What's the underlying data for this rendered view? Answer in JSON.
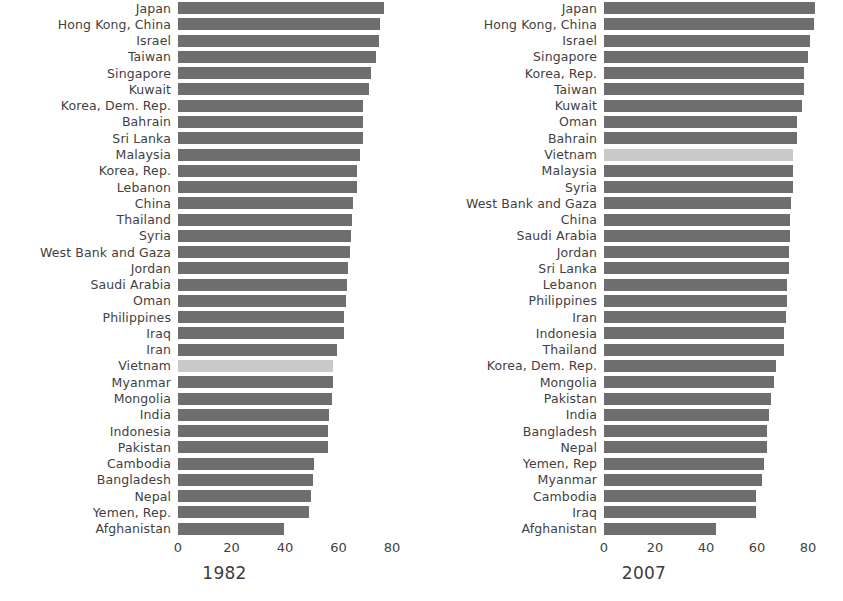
{
  "chart_data": [
    {
      "type": "bar",
      "orientation": "horizontal",
      "title": "1982",
      "xlabel": "",
      "ylabel": "",
      "xlim": [
        0,
        84
      ],
      "xticks": [
        0,
        20,
        40,
        60,
        80
      ],
      "grid": false,
      "legend": null,
      "highlight_category": "Vietnam",
      "colors": {
        "bar": "#6e6e6e",
        "highlight": "#c9c9c9",
        "text": "#3f3f3f"
      },
      "categories": [
        "Japan",
        "Hong Kong, China",
        "Israel",
        "Taiwan",
        "Singapore",
        "Kuwait",
        "Korea, Dem. Rep.",
        "Bahrain",
        "Sri Lanka",
        "Malaysia",
        "Korea, Rep.",
        "Lebanon",
        "China",
        "Thailand",
        "Syria",
        "West Bank and Gaza",
        "Jordan",
        "Saudi Arabia",
        "Oman",
        "Philippines",
        "Iraq",
        "Iran",
        "Vietnam",
        "Myanmar",
        "Mongolia",
        "India",
        "Indonesia",
        "Pakistan",
        "Cambodia",
        "Bangladesh",
        "Nepal",
        "Yemen, Rep.",
        "Afghanistan"
      ],
      "values": [
        77.1,
        75.4,
        75.0,
        74.0,
        72.0,
        71.3,
        69.1,
        69.1,
        69.0,
        68.0,
        67.1,
        66.9,
        65.5,
        65.0,
        64.6,
        64.4,
        63.7,
        63.0,
        62.7,
        62.1,
        62.0,
        59.6,
        58.0,
        58.0,
        57.5,
        56.6,
        56.2,
        56.2,
        50.9,
        50.3,
        49.6,
        49.1,
        39.8
      ]
    },
    {
      "type": "bar",
      "orientation": "horizontal",
      "title": "2007",
      "xlabel": "",
      "ylabel": "",
      "xlim": [
        0,
        84
      ],
      "xticks": [
        0,
        20,
        40,
        60,
        80
      ],
      "grid": false,
      "legend": null,
      "highlight_category": "Vietnam",
      "colors": {
        "bar": "#6e6e6e",
        "highlight": "#c9c9c9",
        "text": "#3f3f3f"
      },
      "categories": [
        "Japan",
        "Hong Kong, China",
        "Israel",
        "Singapore",
        "Korea, Rep.",
        "Taiwan",
        "Kuwait",
        "Oman",
        "Bahrain",
        "Vietnam",
        "Malaysia",
        "Syria",
        "West Bank and Gaza",
        "China",
        "Saudi Arabia",
        "Jordan",
        "Sri Lanka",
        "Lebanon",
        "Philippines",
        "Iran",
        "Indonesia",
        "Thailand",
        "Korea, Dem. Rep.",
        "Mongolia",
        "Pakistan",
        "India",
        "Bangladesh",
        "Nepal",
        "Yemen, Rep",
        "Myanmar",
        "Cambodia",
        "Iraq",
        "Afghanistan"
      ],
      "values": [
        82.6,
        82.2,
        80.7,
        80.0,
        78.6,
        78.4,
        77.6,
        75.6,
        75.6,
        74.2,
        74.2,
        74.1,
        73.3,
        73.0,
        72.8,
        72.5,
        72.4,
        71.9,
        71.7,
        71.2,
        70.6,
        70.6,
        67.3,
        66.8,
        65.5,
        64.7,
        64.1,
        63.8,
        62.7,
        62.1,
        59.7,
        59.5,
        43.8
      ]
    }
  ],
  "panels": {
    "left": {
      "title": "1982",
      "tick_labels": [
        "0",
        "20",
        "40",
        "60",
        "80"
      ]
    },
    "right": {
      "title": "2007",
      "tick_labels": [
        "0",
        "20",
        "40",
        "60",
        "80"
      ]
    }
  }
}
